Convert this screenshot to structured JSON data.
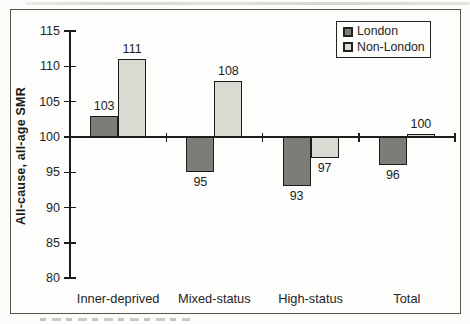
{
  "figure": {
    "background": "#fdfdfb",
    "border_color": "#56564f",
    "axis_color": "#1c1c1a"
  },
  "chart_data": {
    "type": "bar",
    "title": "",
    "xlabel": "",
    "ylabel": "All-cause, all-age SMR",
    "categories": [
      "Inner-deprived",
      "Mixed-status",
      "High-status",
      "Total"
    ],
    "series": [
      {
        "name": "London",
        "color": "#7c7c78",
        "values": [
          103,
          95,
          93,
          96
        ]
      },
      {
        "name": "Non-London",
        "color": "#dbdad2",
        "values": [
          111,
          108,
          97,
          100
        ]
      }
    ],
    "baseline": 100,
    "ylim": [
      80,
      115
    ],
    "yticks": [
      80,
      85,
      90,
      95,
      100,
      105,
      110,
      115
    ],
    "grid": false,
    "legend_position": "top-right",
    "value_labels": true
  }
}
